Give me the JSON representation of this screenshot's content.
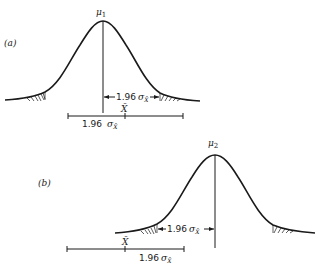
{
  "figure": {
    "panels": [
      {
        "id": "a",
        "label": "(a)",
        "mean_label": "μ",
        "mean_subscript": "1",
        "arrow_label": "1.96",
        "arrow_sigma": "σ",
        "arrow_sigma_sub": "X̄",
        "sample_mean_label": "X̄",
        "bar_label": "1.96",
        "bar_sigma": "σ",
        "bar_sigma_sub": "X̄"
      },
      {
        "id": "b",
        "label": "(b)",
        "mean_label": "μ",
        "mean_subscript": "2",
        "arrow_label": "1.96",
        "arrow_sigma": "σ",
        "arrow_sigma_sub": "X̄",
        "sample_mean_label": "X̄",
        "bar_label": "1.96",
        "bar_sigma": "σ",
        "bar_sigma_sub": "X̄"
      }
    ],
    "colors": {
      "ink": "#1a1a1a",
      "background": "#ffffff"
    }
  }
}
